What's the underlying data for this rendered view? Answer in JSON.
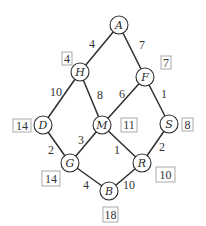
{
  "diagram": {
    "type": "weighted-graph",
    "colors": {
      "line": "#2e2e2e",
      "text": "#333333",
      "box_border": "#a0a0a0",
      "background": "#ffffff"
    },
    "nodes": [
      {
        "id": "A",
        "label": "A",
        "x": 119,
        "y": 25
      },
      {
        "id": "H",
        "label": "H",
        "x": 80,
        "y": 72
      },
      {
        "id": "F",
        "label": "F",
        "x": 145,
        "y": 77
      },
      {
        "id": "D",
        "label": "D",
        "x": 43,
        "y": 125
      },
      {
        "id": "M",
        "label": "M",
        "x": 102,
        "y": 125
      },
      {
        "id": "S",
        "label": "S",
        "x": 169,
        "y": 124
      },
      {
        "id": "G",
        "label": "G",
        "x": 70,
        "y": 163
      },
      {
        "id": "R",
        "label": "R",
        "x": 142,
        "y": 163
      },
      {
        "id": "B",
        "label": "B",
        "x": 109,
        "y": 191
      }
    ],
    "edges": [
      {
        "from": "A",
        "to": "H",
        "weight": "4",
        "lx": 92,
        "ly": 48
      },
      {
        "from": "A",
        "to": "F",
        "weight": "7",
        "lx": 142,
        "ly": 49
      },
      {
        "from": "H",
        "to": "D",
        "weight": "10",
        "lx": 56,
        "ly": 96
      },
      {
        "from": "H",
        "to": "M",
        "weight": "8",
        "lx": 100,
        "ly": 99
      },
      {
        "from": "F",
        "to": "M",
        "weight": "6",
        "lx": 122,
        "ly": 98
      },
      {
        "from": "F",
        "to": "S",
        "weight": "1",
        "lx": 164,
        "ly": 98
      },
      {
        "from": "D",
        "to": "G",
        "weight": "2",
        "lx": 51,
        "ly": 154
      },
      {
        "from": "M",
        "to": "G",
        "weight": "3",
        "lx": 81,
        "ly": 144
      },
      {
        "from": "M",
        "to": "R",
        "weight": "1",
        "lx": 117,
        "ly": 154
      },
      {
        "from": "S",
        "to": "R",
        "weight": "2",
        "lx": 162,
        "ly": 151
      },
      {
        "from": "G",
        "to": "B",
        "weight": "4",
        "lx": 86,
        "ly": 189
      },
      {
        "from": "R",
        "to": "B",
        "weight": "10",
        "lx": 129,
        "ly": 189
      }
    ],
    "distances": [
      {
        "node": "H",
        "value": "4",
        "x": 62,
        "y": 52,
        "w": 10,
        "h": 13
      },
      {
        "node": "F",
        "value": "7",
        "x": 161,
        "y": 56,
        "w": 10,
        "h": 13
      },
      {
        "node": "D",
        "value": "14",
        "x": 13,
        "y": 119,
        "w": 18,
        "h": 13
      },
      {
        "node": "M",
        "value": "11",
        "x": 121,
        "y": 118,
        "w": 16,
        "h": 14
      },
      {
        "node": "S",
        "value": "8",
        "x": 182,
        "y": 118,
        "w": 11,
        "h": 13
      },
      {
        "node": "G",
        "value": "14",
        "x": 42,
        "y": 171,
        "w": 18,
        "h": 15
      },
      {
        "node": "R",
        "value": "10",
        "x": 156,
        "y": 167,
        "w": 19,
        "h": 15
      },
      {
        "node": "B",
        "value": "18",
        "x": 103,
        "y": 207,
        "w": 15,
        "h": 15
      }
    ]
  }
}
